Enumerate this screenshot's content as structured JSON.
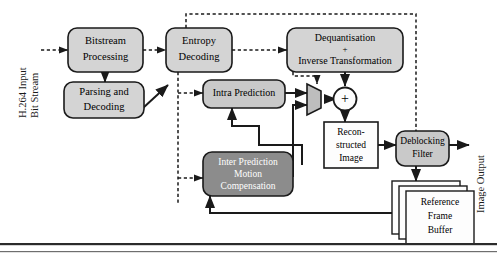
{
  "diagram": {
    "colors": {
      "box_light_fill": "#d4d4d4",
      "box_mid_fill": "#8c8c8c",
      "box_white_fill": "#fdfdfd",
      "stroke": "#1a1a1a",
      "white_text": "#ffffff",
      "black_text": "#000000",
      "bottom_rule": "#2b2b2b"
    },
    "edge_labels": {
      "input": "H.264 Input Bit Stream",
      "input_line1": "H.264 Input",
      "input_line2": "Bit Stream",
      "output": "Image Output"
    },
    "nodes": [
      {
        "id": "bitstream",
        "label": "Bitstream Processing",
        "lines": [
          "Bitstream",
          "Processing"
        ],
        "shape": "rounded",
        "fill": "light"
      },
      {
        "id": "parsing",
        "label": "Parsing and Decoding",
        "lines": [
          "Parsing and",
          "Decoding"
        ],
        "shape": "rounded",
        "fill": "light"
      },
      {
        "id": "entropy",
        "label": "Entropy Decoding",
        "lines": [
          "Entropy",
          "Decoding"
        ],
        "shape": "rounded",
        "fill": "light"
      },
      {
        "id": "dequant",
        "label": "Dequantisation + Inverse Transformation",
        "lines": [
          "Dequantisation",
          "+",
          "Inverse Transformation"
        ],
        "shape": "rounded",
        "fill": "light"
      },
      {
        "id": "intra",
        "label": "Intra Prediction",
        "lines": [
          "Intra Prediction"
        ],
        "shape": "rounded",
        "fill": "light"
      },
      {
        "id": "inter",
        "label": "Inter Prediction Motion Compensation",
        "lines": [
          "Inter Prediction",
          "Motion",
          "Compensation"
        ],
        "shape": "rounded",
        "fill": "mid"
      },
      {
        "id": "mux",
        "label": "Multiplexer",
        "shape": "trapezoid",
        "fill": "light"
      },
      {
        "id": "adder",
        "label": "+",
        "shape": "circle",
        "fill": "white"
      },
      {
        "id": "recon",
        "label": "Reconstructed Image",
        "lines": [
          "Recon-",
          "structed",
          "Image"
        ],
        "shape": "rect",
        "fill": "white"
      },
      {
        "id": "deblock",
        "label": "Deblocking Filter",
        "lines": [
          "Deblocking",
          "Filter"
        ],
        "shape": "rounded",
        "fill": "light"
      },
      {
        "id": "refbuffer",
        "label": "Reference Frame Buffer",
        "lines": [
          "Reference",
          "Frame",
          "Buffer"
        ],
        "shape": "stack",
        "fill": "white"
      }
    ]
  }
}
